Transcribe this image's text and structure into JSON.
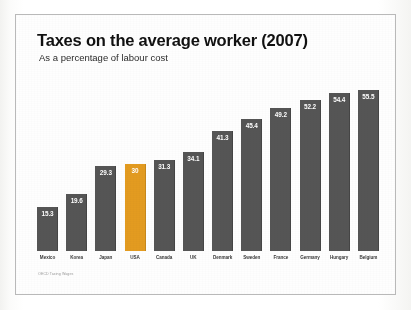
{
  "slide": {
    "title": "Taxes on the average worker (2007)",
    "subtitle": "As a percentage of labour cost",
    "source_note": "OECD Taxing Wages"
  },
  "colors": {
    "bar": "#555555",
    "accent": "#e39b20",
    "value_label": "#ffffff",
    "axis_label": "#3a3a3a",
    "frame": "#b9b9b9",
    "background": "#ffffff"
  },
  "chart_data": {
    "type": "bar",
    "title": "Taxes on the average worker (2007)",
    "subtitle": "As a percentage of labour cost",
    "xlabel": "",
    "ylabel": "",
    "ylim": [
      0,
      60
    ],
    "grid": false,
    "legend": false,
    "highlight_category": "USA",
    "categories": [
      "Mexico",
      "Korea",
      "Japan",
      "USA",
      "Canada",
      "UK",
      "Denmark",
      "Sweden",
      "France",
      "Germany",
      "Hungary",
      "Belgium"
    ],
    "values": [
      15.3,
      19.6,
      29.3,
      30,
      31.3,
      34.1,
      41.3,
      45.4,
      49.2,
      52.2,
      54.4,
      55.5
    ],
    "value_labels": [
      "15.3",
      "19.6",
      "29.3",
      "30",
      "31.3",
      "34.1",
      "41.3",
      "45.4",
      "49.2",
      "52.2",
      "54.4",
      "55.5"
    ]
  }
}
